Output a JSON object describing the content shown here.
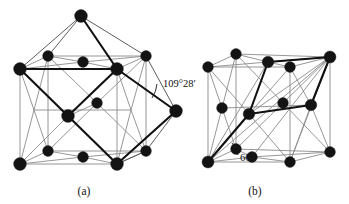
{
  "figure": {
    "background_color": "#ffffff",
    "atom_color": "#131313",
    "thin_line_color": "#8b8b8b",
    "bold_line_color": "#111111",
    "panels": [
      {
        "id": "a",
        "caption": "(a)",
        "caption_x": 84,
        "caption_y": 195,
        "annotation": {
          "label": "109°28′",
          "x": 163,
          "y": 87
        },
        "description": "face-centred cubic cell with bold tetrahedral bond angle outline"
      },
      {
        "id": "b",
        "caption": "(b)",
        "caption_x": 255,
        "caption_y": 195,
        "annotation": {
          "label": "60°",
          "x": 240,
          "y": 161
        },
        "description": "face-centred cubic cell with bold rhombohedral primitive cell outline"
      }
    ]
  },
  "geometry": {
    "panel_a": {
      "cube": {
        "front_top_left": [
          20,
          69
        ],
        "front_top_right": [
          117,
          69
        ],
        "front_bottom_right": [
          117,
          164
        ],
        "front_bottom_left": [
          20,
          164
        ],
        "back_top_left": [
          48,
          56
        ],
        "back_top_right": [
          146,
          56
        ],
        "back_bottom_right": [
          146,
          151
        ],
        "back_bottom_left": [
          48,
          151
        ]
      },
      "face_centres": {
        "front": [
          68,
          116
        ],
        "back": [
          97,
          103
        ],
        "top": [
          83,
          62
        ],
        "bottom": [
          83,
          157
        ],
        "left": [
          34,
          110
        ],
        "right": [
          131,
          110
        ]
      },
      "apex_top": [
        81,
        16
      ],
      "apex_right": [
        176,
        111
      ],
      "bold_path": [
        [
          20,
          69
        ],
        [
          68,
          116
        ],
        [
          117,
          164
        ],
        [
          117,
          69
        ],
        [
          20,
          69
        ]
      ],
      "bold_path2": [
        [
          81,
          16
        ],
        [
          117,
          69
        ],
        [
          176,
          111
        ]
      ]
    },
    "panel_b": {
      "cube": {
        "front_top_left": [
          208,
          67
        ],
        "front_top_right": [
          290,
          67
        ],
        "front_bottom_right": [
          290,
          162
        ],
        "front_bottom_left": [
          208,
          162
        ],
        "back_top_left": [
          236,
          54
        ],
        "back_top_right": [
          330,
          57
        ],
        "back_bottom_right": [
          330,
          152
        ],
        "back_bottom_left": [
          236,
          149
        ]
      },
      "rhombohedron": [
        [
          208,
          162
        ],
        [
          268,
          125
        ],
        [
          330,
          57
        ],
        [
          268,
          62
        ]
      ]
    }
  },
  "atoms": {
    "panel_a_count": 14,
    "panel_b_count": 14
  }
}
